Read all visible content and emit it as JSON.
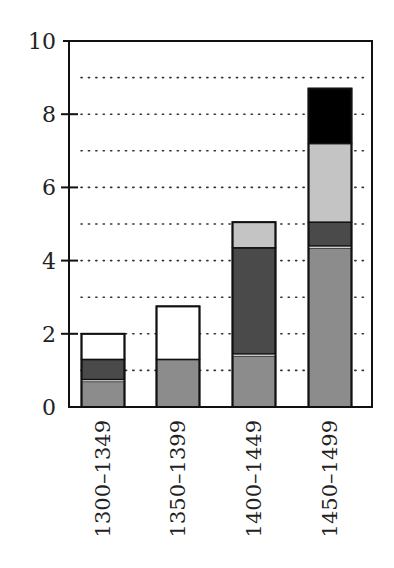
{
  "chart_data": {
    "type": "bar",
    "stacked": true,
    "title": "",
    "xlabel": "",
    "ylabel": "",
    "ylim": [
      0,
      10
    ],
    "yticks": [
      0,
      2,
      4,
      6,
      8,
      10
    ],
    "ytick_labels": [
      "0",
      "2",
      "4",
      "6",
      "8",
      "10"
    ],
    "grid": {
      "style": "dotted",
      "horizontal_at": [
        1,
        2,
        3,
        4,
        5,
        6,
        7,
        8,
        9
      ]
    },
    "legend": null,
    "categories": [
      "1300–1349",
      "1350–1399",
      "1400–1449",
      "1450–1499"
    ],
    "series": [
      {
        "name": "medium-gray",
        "color": "#8c8c8c",
        "values": [
          0.7,
          1.3,
          1.4,
          4.35
        ]
      },
      {
        "name": "white-separator",
        "color": "#ffffff",
        "values": [
          0.05,
          0,
          0.05,
          0.05
        ]
      },
      {
        "name": "dark-gray",
        "color": "#4a4a4a",
        "values": [
          0.55,
          0,
          2.9,
          0.65
        ]
      },
      {
        "name": "light-gray",
        "color": "#c4c4c4",
        "values": [
          0,
          0,
          0.7,
          2.15
        ]
      },
      {
        "name": "black",
        "color": "#000000",
        "values": [
          0,
          0,
          0,
          1.5
        ]
      },
      {
        "name": "white",
        "color": "#ffffff",
        "values": [
          0.7,
          1.45,
          0,
          0
        ]
      }
    ],
    "totals": [
      2.0,
      2.75,
      5.05,
      8.7
    ]
  }
}
